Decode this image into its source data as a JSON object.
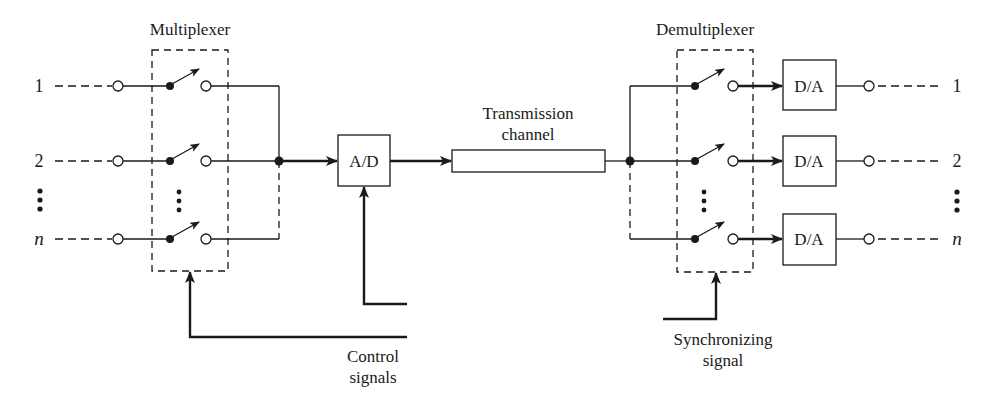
{
  "diagram": {
    "type": "block-diagram",
    "title_left": "Multiplexer",
    "title_right": "Demultiplexer",
    "channel_label_line1": "Transmission",
    "channel_label_line2": "channel",
    "converter_in": "A/D",
    "converter_out": "D/A",
    "control_label_line1": "Control",
    "control_label_line2": "signals",
    "sync_label_line1": "Synchronizing",
    "sync_label_line2": "signal",
    "inputs": [
      {
        "label": "1"
      },
      {
        "label": "2"
      },
      {
        "label": "n"
      }
    ],
    "outputs": [
      {
        "label": "1",
        "converter": "D/A"
      },
      {
        "label": "2",
        "converter": "D/A"
      },
      {
        "label": "n",
        "converter": "D/A"
      }
    ],
    "ellipsis": "⋮",
    "colors": {
      "line": "#1a1a1a",
      "background": "#ffffff"
    }
  }
}
